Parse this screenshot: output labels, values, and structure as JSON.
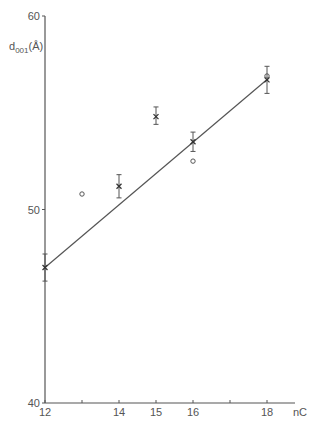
{
  "chart_data": {
    "type": "scatter",
    "title": "",
    "xlabel": "nC",
    "ylabel": "d001(Å)",
    "ylabel_main": "d",
    "ylabel_sub": "001",
    "ylabel_unit": "(Å)",
    "xlim": [
      12,
      19
    ],
    "ylim": [
      40,
      60
    ],
    "x_ticks": [
      12,
      13,
      14,
      15,
      16,
      17,
      18
    ],
    "x_tick_labels": [
      "12",
      "",
      "14",
      "15",
      "16",
      "",
      "18"
    ],
    "y_ticks": [
      40,
      50,
      60
    ],
    "y_tick_labels": [
      "40",
      "50",
      "60"
    ],
    "grid": false,
    "series": [
      {
        "name": "crosses with error bars",
        "marker": "x",
        "points": [
          {
            "x": 12,
            "y": 47.0,
            "err_low": 46.3,
            "err_high": 47.7
          },
          {
            "x": 14,
            "y": 51.2,
            "err_low": 50.6,
            "err_high": 51.8
          },
          {
            "x": 15,
            "y": 54.8,
            "err_low": 54.4,
            "err_high": 55.3
          },
          {
            "x": 16,
            "y": 53.5,
            "err_low": 53.0,
            "err_high": 54.0
          },
          {
            "x": 18,
            "y": 56.7,
            "err_low": 56.0,
            "err_high": 57.4
          }
        ]
      },
      {
        "name": "open circles",
        "marker": "o",
        "points": [
          {
            "x": 13,
            "y": 50.8
          },
          {
            "x": 16,
            "y": 52.5
          },
          {
            "x": 18,
            "y": 56.9
          }
        ]
      },
      {
        "name": "linear fit",
        "type": "line",
        "points": [
          {
            "x": 12,
            "y": 47.0
          },
          {
            "x": 18.05,
            "y": 56.8
          }
        ]
      }
    ]
  }
}
